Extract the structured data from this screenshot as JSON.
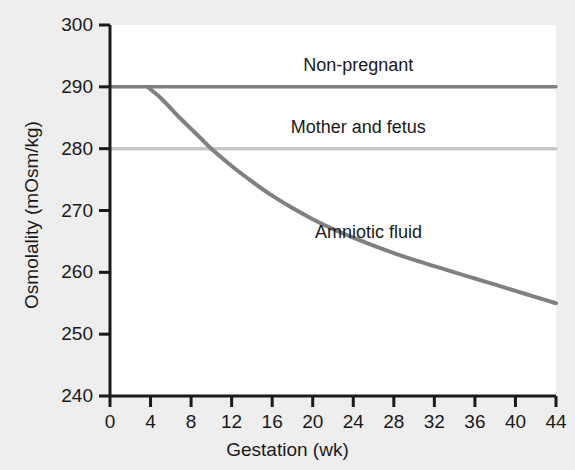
{
  "chart_data": {
    "type": "line",
    "title": "",
    "xlabel": "Gestation (wk)",
    "ylabel": "Osmolality (mOsm/kg)",
    "xlim": [
      0,
      44
    ],
    "ylim": [
      240,
      300
    ],
    "xticks": [
      "0",
      "4",
      "8",
      "12",
      "16",
      "20",
      "24",
      "28",
      "32",
      "36",
      "40",
      "44"
    ],
    "yticks": [
      "300",
      "290",
      "280",
      "270",
      "260",
      "250",
      "240"
    ],
    "grid": false,
    "legend_position": "inline-annotations",
    "series": [
      {
        "name": "Non-pregnant",
        "color": "#7f7f7f",
        "style": "horizontal-line",
        "x": [
          0,
          44
        ],
        "values": [
          290,
          290
        ],
        "label": "Non-pregnant",
        "label_x": 24.5,
        "label_y": 293.5
      },
      {
        "name": "Mother and fetus",
        "color": "#c8c8c8",
        "style": "horizontal-line",
        "x": [
          0,
          44
        ],
        "values": [
          280,
          280
        ],
        "label": "Mother and fetus",
        "label_x": 24.5,
        "label_y": 283.5
      },
      {
        "name": "Amniotic fluid",
        "color": "#808080",
        "style": "curve",
        "label": "Amniotic fluid",
        "label_x": 25.5,
        "label_y": 266.5,
        "x": [
          3.7,
          5,
          6,
          7,
          8,
          9,
          10,
          12,
          14,
          16,
          18,
          20,
          22,
          24,
          26,
          28,
          30,
          32,
          34,
          36,
          38,
          40,
          42,
          44
        ],
        "values": [
          290,
          288.2,
          286.5,
          284.8,
          283.2,
          281.6,
          280,
          277.2,
          274.7,
          272.4,
          270.4,
          268.6,
          267.0,
          265.6,
          264.3,
          263.1,
          262.0,
          261.0,
          260.0,
          259.0,
          258.0,
          257.0,
          256.0,
          255.0
        ]
      }
    ]
  },
  "axis": {
    "x_title": "Gestation (wk)",
    "y_title": "Osmolality (mOsm/kg)"
  }
}
